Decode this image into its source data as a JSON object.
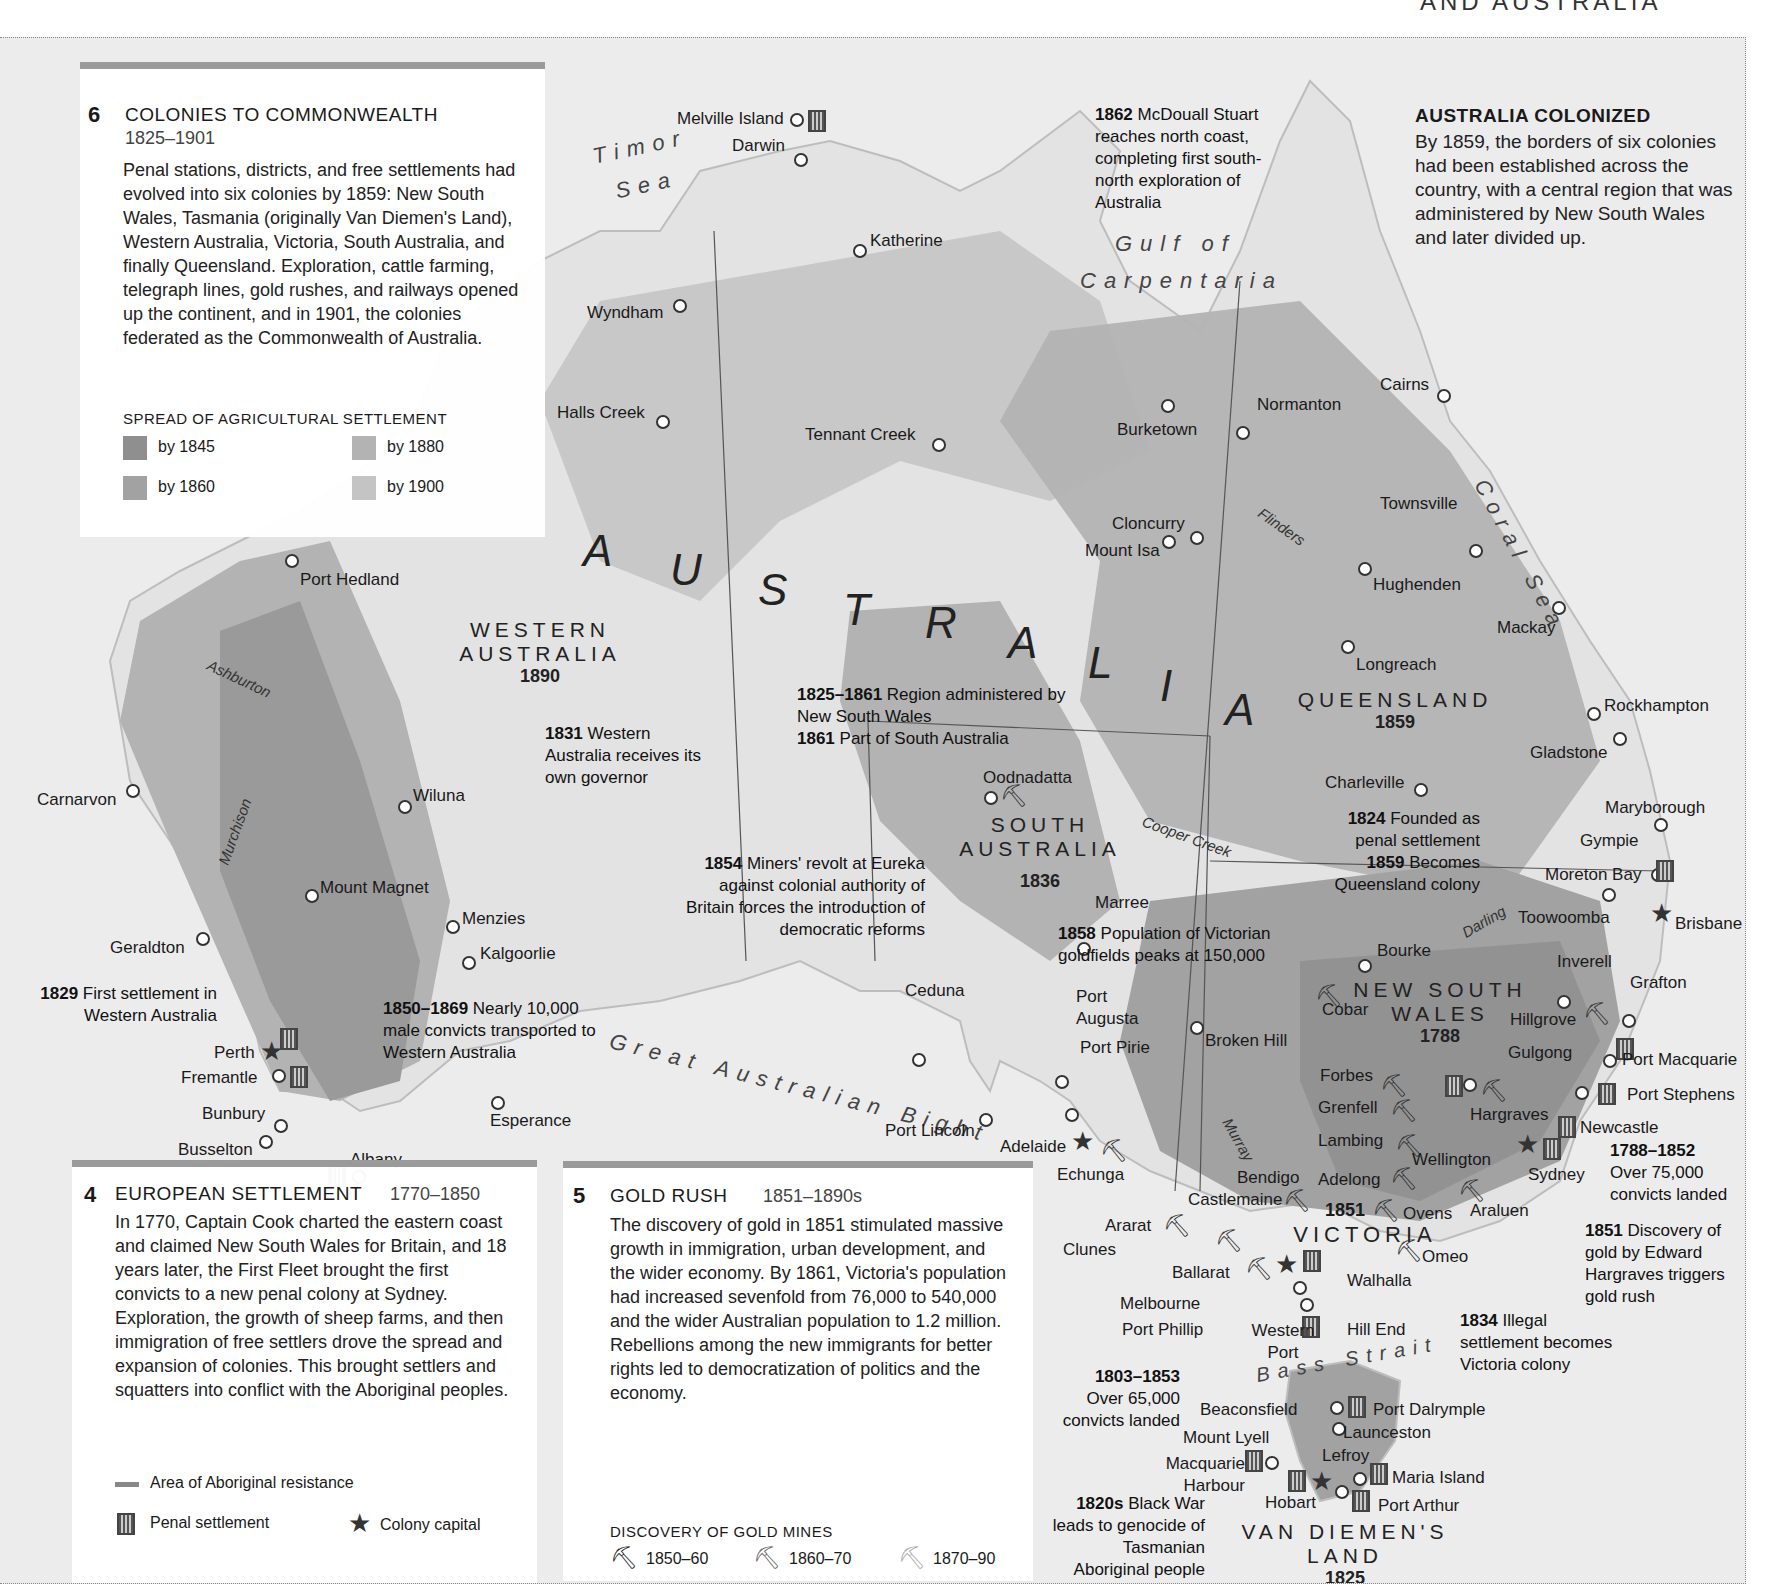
{
  "header_fragment": "AND AUSTRALIA",
  "panel6": {
    "number": "6",
    "title": "COLONIES TO COMMONWEALTH",
    "dates": "1825–1901",
    "body": "Penal stations, districts, and free settlements had evolved into six colonies by 1859: New South Wales, Tasmania (originally Van Diemen's Land), Western Australia, Victoria, South Australia, and finally Queensland. Exploration, cattle farming, telegraph lines, gold rushes, and railways opened up the continent, and in 1901, the colonies federated as the Commonwealth of Australia.",
    "legend_title": "SPREAD OF AGRICULTURAL SETTLEMENT",
    "legend": [
      {
        "label": "by 1845",
        "color": "#8f8f8f"
      },
      {
        "label": "by 1880",
        "color": "#b3b3b3"
      },
      {
        "label": "by 1860",
        "color": "#a2a2a2"
      },
      {
        "label": "by 1900",
        "color": "#c4c4c4"
      }
    ]
  },
  "colonized": {
    "title": "AUSTRALIA COLONIZED",
    "body": "By 1859, the borders of six colonies had been established across the country, with a central region that was administered by New South Wales and later divided up."
  },
  "panel4": {
    "number": "4",
    "title": "EUROPEAN SETTLEMENT",
    "dates": "1770–1850",
    "body": "In 1770, Captain Cook charted the eastern coast and claimed New South Wales for Britain, and 18 years later, the First Fleet brought the first convicts to a new penal colony at Sydney. Exploration, the growth of sheep farms, and then immigration of free settlers drove the spread and expansion of colonies. This brought settlers and squatters into conflict with the Aboriginal peoples.",
    "legend": {
      "resistance": "Area of Aboriginal resistance",
      "penal": "Penal settlement",
      "capital": "Colony capital"
    }
  },
  "panel5": {
    "number": "5",
    "title": "GOLD RUSH",
    "dates": "1851–1890s",
    "body": "The discovery of gold in 1851 stimulated massive growth in immigration, urban development, and the wider economy. By 1861, Victoria's population had increased sevenfold from 76,000 to 540,000 and the wider Australian population to 1.2 million. Rebellions among the new immigrants for better rights led to democratization of politics and the economy.",
    "legend_title": "DISCOVERY OF GOLD MINES",
    "legend": [
      {
        "label": "1850–60",
        "color": "#222222"
      },
      {
        "label": "1860–70",
        "color": "#666666"
      },
      {
        "label": "1870–90",
        "color": "#aaaaaa"
      }
    ]
  },
  "regions": {
    "wa": {
      "name1": "WESTERN",
      "name2": "AUSTRALIA",
      "year": "1890"
    },
    "sa": {
      "name1": "SOUTH",
      "name2": "AUSTRALIA",
      "year": "1836"
    },
    "qld": {
      "name1": "QUEENSLAND",
      "year": "1859"
    },
    "nsw": {
      "name1": "NEW SOUTH",
      "name2": "WALES",
      "year": "1788"
    },
    "vic": {
      "name1": "VICTORIA",
      "year": "1851"
    },
    "vdl": {
      "name1": "VAN DIEMEN'S",
      "name2": "LAND",
      "year": "1825"
    }
  },
  "big_label": [
    "A",
    "U",
    "S",
    "T",
    "R",
    "A",
    "L",
    "I",
    "A"
  ],
  "seas": {
    "timor1": "Timor",
    "timor2": "Sea",
    "gulf1": "Gulf of",
    "gulf2": "Carpentaria",
    "coral": "Coral Sea",
    "bight": "Great Australian Bight",
    "bass": "Bass Strait"
  },
  "rivers": {
    "ashburton": "Ashburton",
    "murchison": "Murchison",
    "flinders": "Flinders",
    "cooper": "Cooper Creek",
    "darling": "Darling",
    "murray": "Murray"
  },
  "cities": [
    "Melville Island",
    "Darwin",
    "Katherine",
    "Wyndham",
    "Halls Creek",
    "Tennant Creek",
    "Burketown",
    "Normanton",
    "Cairns",
    "Townsville",
    "Cloncurry",
    "Mount Isa",
    "Hughenden",
    "Mackay",
    "Longreach",
    "Rockhampton",
    "Gladstone",
    "Charleville",
    "Maryborough",
    "Gympie",
    "Moreton Bay",
    "Toowoomba",
    "Brisbane",
    "Port Hedland",
    "Carnarvon",
    "Wiluna",
    "Mount Magnet",
    "Menzies",
    "Kalgoorlie",
    "Geraldton",
    "Perth",
    "Fremantle",
    "Bunbury",
    "Busselton",
    "Albany",
    "Esperance",
    "Oodnadatta",
    "Marree",
    "Ceduna",
    "Port Augusta",
    "Port Pirie",
    "Port Lincoln",
    "Adelaide",
    "Echunga",
    "Bourke",
    "Cobar",
    "Broken Hill",
    "Inverell",
    "Grafton",
    "Hillgrove",
    "Gulgong",
    "Port Macquarie",
    "Forbes",
    "Port Stephens",
    "Grenfell",
    "Hargraves",
    "Newcastle",
    "Lambing",
    "Wellington",
    "Sydney",
    "Bendigo",
    "Adelong",
    "Castlemaine",
    "Ovens",
    "Araluen",
    "Ararat",
    "Clunes",
    "Omeo",
    "Ballarat",
    "Walhalla",
    "Melbourne",
    "Port Phillip",
    "Western Port",
    "Hill End",
    "Beaconsfield",
    "Port Dalrymple",
    "Mount Lyell",
    "Launceston",
    "Lefroy",
    "Macquarie Harbour",
    "Maria Island",
    "Hobart",
    "Port Arthur"
  ],
  "notes": {
    "n1862": {
      "year": "1862",
      "text": "McDouall Stuart reaches north coast, completing first south-north exploration of Australia"
    },
    "n1831": {
      "year": "1831",
      "text": "Western Australia receives its own governor"
    },
    "n1825": {
      "year": "1825–1861",
      "text": "Region administered by New South Wales",
      "year2": "1861",
      "text2": "Part of South Australia"
    },
    "n1854": {
      "year": "1854",
      "text": "Miners' revolt at Eureka against colonial authority of Britain forces the introduction of democratic reforms"
    },
    "n1858": {
      "year": "1858",
      "text": "Population of Victorian goldfields peaks at 150,000"
    },
    "n1824": {
      "year": "1824",
      "text": "Founded as penal settlement",
      "year2": "1859",
      "text2": "Becomes Queensland colony"
    },
    "n1829": {
      "year": "1829",
      "text": "First settlement in Western Australia"
    },
    "n1850": {
      "year": "1850–1869",
      "text": "Nearly 10,000 male convicts transported to Western Australia"
    },
    "n1788": {
      "year": "1788–1852",
      "text": "Over 75,000 convicts landed"
    },
    "n1851": {
      "year": "1851",
      "text": "Discovery of gold by Edward Hargraves triggers gold rush"
    },
    "n1834": {
      "year": "1834",
      "text": "Illegal settlement becomes Victoria colony"
    },
    "n1803": {
      "year": "1803–1853",
      "text": "Over 65,000 convicts landed"
    },
    "n1820": {
      "year": "1820s",
      "text": "Black War leads to genocide of Tasmanian Aboriginal people"
    }
  },
  "colors": {
    "sea": "#ececec",
    "land": "#e2e2e2",
    "s1845": "#8f8f8f",
    "s1860": "#a2a2a2",
    "s1880": "#b3b3b3",
    "s1900": "#c4c4c4",
    "bar": "#9a9a9a"
  }
}
